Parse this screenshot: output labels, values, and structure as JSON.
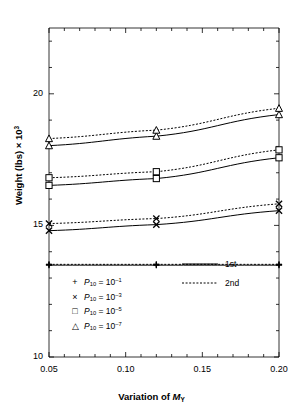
{
  "chart_data": {
    "type": "line",
    "title": "",
    "xlabel": "Variation of M_Y",
    "xlabel_parts": {
      "prefix": "Variation of ",
      "italic": "M",
      "sub": "Y"
    },
    "ylabel": "Weight (lbs) × 10³",
    "ylabel_parts": {
      "prefix": "Weight (lbs) × 10",
      "sup": "3"
    },
    "x": [
      0.05,
      0.12,
      0.2
    ],
    "xlim": [
      0.05,
      0.2
    ],
    "ylim": [
      10,
      22.5
    ],
    "xticks": [
      0.05,
      0.1,
      0.15,
      0.2
    ],
    "xtick_labels": [
      "0.05",
      "0.10",
      "0.15",
      "0.20"
    ],
    "yticks": [
      10,
      15,
      20
    ],
    "ytick_labels": [
      "10",
      "15",
      "20"
    ],
    "x_minor_ticks": [
      0.06,
      0.07,
      0.08,
      0.09,
      0.11,
      0.12,
      0.13,
      0.14,
      0.16,
      0.17,
      0.18,
      0.19
    ],
    "y_minor_ticks": [
      11,
      12,
      13,
      14,
      16,
      17,
      18,
      19,
      21,
      22
    ],
    "grid": false,
    "legend_position": "inside-bottom",
    "series": [
      {
        "name": "P10 = 10^-1, 1st",
        "marker": "plus",
        "style": "solid",
        "values": [
          13.49,
          13.49,
          13.49
        ]
      },
      {
        "name": "P10 = 10^-1, 2nd",
        "marker": "plus",
        "style": "dotted",
        "values": [
          13.52,
          13.52,
          13.52
        ]
      },
      {
        "name": "P10 = 10^-3, 1st",
        "marker": "cross",
        "style": "solid",
        "values": [
          14.8,
          15.03,
          15.56
        ]
      },
      {
        "name": "P10 = 10^-3, 2nd",
        "marker": "cross",
        "style": "dotted",
        "values": [
          15.07,
          15.26,
          15.82
        ]
      },
      {
        "name": "P10 = 10^-5, 1st",
        "marker": "square",
        "style": "solid",
        "values": [
          16.52,
          16.78,
          17.57
        ]
      },
      {
        "name": "P10 = 10^-5, 2nd",
        "marker": "square",
        "style": "dotted",
        "values": [
          16.81,
          17.04,
          17.87
        ]
      },
      {
        "name": "P10 = 10^-7, 1st",
        "marker": "triangle",
        "style": "solid",
        "values": [
          18.03,
          18.39,
          19.21
        ]
      },
      {
        "name": "P10 = 10^-7, 2nd",
        "marker": "triangle",
        "style": "dotted",
        "values": [
          18.3,
          18.62,
          19.45
        ]
      }
    ],
    "marker_legend": [
      {
        "symbol": "+",
        "label_prefix": "P",
        "label_sub": "10",
        "label_eq": " = 10",
        "label_sup": "–1"
      },
      {
        "symbol": "×",
        "label_prefix": "P",
        "label_sub": "10",
        "label_eq": " = 10",
        "label_sup": "–3"
      },
      {
        "symbol": "□",
        "label_prefix": "P",
        "label_sub": "10",
        "label_eq": " = 10",
        "label_sup": "–5"
      },
      {
        "symbol": "△",
        "label_prefix": "P",
        "label_sub": "10",
        "label_eq": " = 10",
        "label_sup": "–7"
      }
    ],
    "style_legend": [
      {
        "label": "1st",
        "style": "solid"
      },
      {
        "label": "2nd",
        "style": "dotted"
      }
    ],
    "colors": {
      "line": "#000000",
      "axis": "#000000",
      "background": "#ffffff"
    }
  }
}
